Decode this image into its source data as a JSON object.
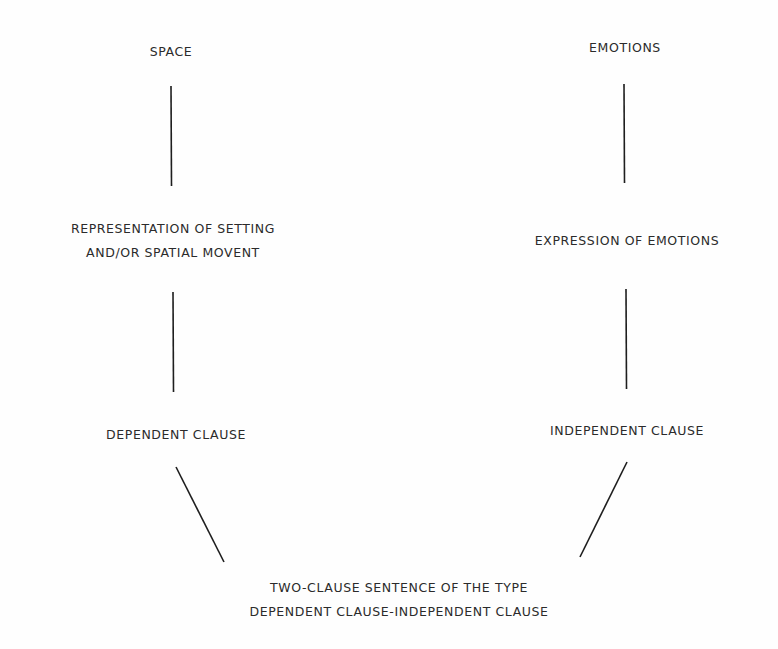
{
  "diagram": {
    "type": "tree",
    "left_branch": {
      "top": "SPACE",
      "middle": [
        "REPRESENTATION OF SETTING",
        "AND/OR SPATIAL MOVENT"
      ],
      "bottom": "DEPENDENT CLAUSE"
    },
    "right_branch": {
      "top": "EMOTIONS",
      "middle": [
        "EXPRESSION OF EMOTIONS"
      ],
      "bottom": "INDEPENDENT CLAUSE"
    },
    "root": [
      "TWO-CLAUSE SENTENCE OF THE TYPE",
      "DEPENDENT CLAUSE-INDEPENDENT CLAUSE"
    ],
    "edges": [
      {
        "from": "SPACE",
        "to": "REPRESENTATION OF SETTING AND/OR SPATIAL MOVENT"
      },
      {
        "from": "REPRESENTATION OF SETTING AND/OR SPATIAL MOVENT",
        "to": "DEPENDENT CLAUSE"
      },
      {
        "from": "EMOTIONS",
        "to": "EXPRESSION OF EMOTIONS"
      },
      {
        "from": "EXPRESSION OF EMOTIONS",
        "to": "INDEPENDENT CLAUSE"
      },
      {
        "from": "DEPENDENT CLAUSE",
        "to": "TWO-CLAUSE SENTENCE OF THE TYPE DEPENDENT CLAUSE-INDEPENDENT CLAUSE"
      },
      {
        "from": "INDEPENDENT CLAUSE",
        "to": "TWO-CLAUSE SENTENCE OF THE TYPE DEPENDENT CLAUSE-INDEPENDENT CLAUSE"
      }
    ],
    "colors": {
      "line": "#1e1e1e",
      "text": "#2b2b2b",
      "background": "#fefefe"
    }
  }
}
